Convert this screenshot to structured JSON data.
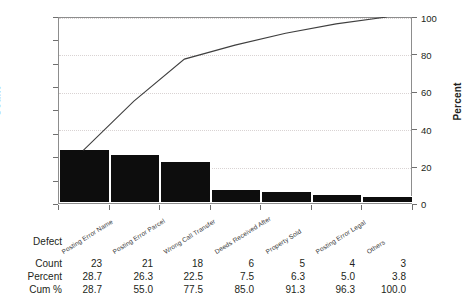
{
  "chart_data": {
    "type": "bar",
    "title": "",
    "xlabel": "Defect",
    "ylabel": "Count",
    "y2label": "Percent",
    "categories": [
      "Posting Error Name",
      "Posting Error Parcel",
      "Wrong Call Transfer",
      "Deeds Received After",
      "Property Sold",
      "Posting Error Legal",
      "Others"
    ],
    "values": [
      23,
      21,
      18,
      6,
      5,
      4,
      3
    ],
    "percent": [
      28.7,
      26.3,
      22.5,
      7.5,
      6.3,
      5.0,
      3.8
    ],
    "cum_percent": [
      28.7,
      55.0,
      77.5,
      85.0,
      91.3,
      96.3,
      100.0
    ],
    "ylim": [
      0,
      80
    ],
    "y2lim": [
      0,
      100
    ],
    "yticks": [
      0,
      10,
      20,
      30,
      40,
      50,
      60,
      70,
      80
    ],
    "y2ticks": [
      0,
      20,
      40,
      60,
      80,
      100
    ],
    "grid": true,
    "legend": "none",
    "series": [
      {
        "name": "Count",
        "type": "bar",
        "values": [
          23,
          21,
          18,
          6,
          5,
          4,
          3
        ]
      },
      {
        "name": "Cum %",
        "type": "line",
        "values": [
          28.7,
          55.0,
          77.5,
          85.0,
          91.3,
          96.3,
          100.0
        ]
      }
    ]
  },
  "axes": {
    "count_title": "Count",
    "percent_title": "Percent",
    "left_ticks": [
      "80",
      "70",
      "60",
      "50",
      "40",
      "30",
      "20",
      "10",
      "0"
    ],
    "right_ticks": [
      "100",
      "80",
      "60",
      "40",
      "20",
      "0"
    ]
  },
  "table": {
    "rows": [
      {
        "label": "Defect",
        "values": [
          "",
          "",
          "",
          "",
          "",
          "",
          ""
        ]
      },
      {
        "label": "Count",
        "values": [
          "23",
          "21",
          "18",
          "6",
          "5",
          "4",
          "3"
        ]
      },
      {
        "label": "Percent",
        "values": [
          "28.7",
          "26.3",
          "22.5",
          "7.5",
          "6.3",
          "5.0",
          "3.8"
        ]
      },
      {
        "label": "Cum %",
        "values": [
          "28.7",
          "55.0",
          "77.5",
          "85.0",
          "91.3",
          "96.3",
          "100.0"
        ]
      }
    ],
    "categories": [
      "Posting Error Name",
      "Posting Error Parcel",
      "Wrong Call Transfer",
      "Deeds Received After",
      "Property Sold",
      "Posting Error Legal",
      "Others"
    ]
  },
  "colors": {
    "bar": "#0d0d0d",
    "line": "#3f3f3f",
    "grid": "#d9d3d3",
    "frame": "#8d8d8d",
    "text": "#231f20"
  }
}
